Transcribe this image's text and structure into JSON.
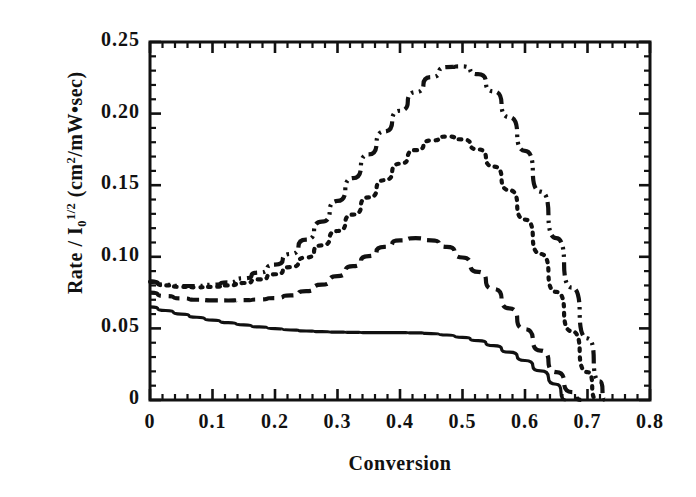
{
  "chart_data": {
    "type": "line",
    "title": "",
    "xlabel": "Conversion",
    "ylabel_parts": {
      "lead": "Rate / I",
      "sub": "0",
      "sup": "1/2",
      "tail": " (cm",
      "sup2": "2",
      "tail2": "/mW•sec)"
    },
    "ylabel_plain": "Rate / I0 1/2 (cm2/mW•sec)",
    "xlim": [
      0,
      0.8
    ],
    "ylim": [
      0,
      0.25
    ],
    "xticks": [
      "0",
      "0.1",
      "0.2",
      "0.3",
      "0.4",
      "0.5",
      "0.6",
      "0.7",
      "0.8"
    ],
    "xtick_values": [
      0,
      0.1,
      0.2,
      0.3,
      0.4,
      0.5,
      0.6,
      0.7,
      0.8
    ],
    "yticks": [
      "0",
      "0.05",
      "0.10",
      "0.15",
      "0.20",
      "0.25"
    ],
    "ytick_values": [
      0,
      0.05,
      0.1,
      0.15,
      0.2,
      0.25
    ],
    "x_minor_per_major": 5,
    "y_minor_per_major": 5,
    "grid": false,
    "legend": "none",
    "frame": true,
    "ticks_direction": "in",
    "line_color": "#111111",
    "series": [
      {
        "name": "solid",
        "style": "solid",
        "dash": "none",
        "x": [
          0.0,
          0.025,
          0.05,
          0.075,
          0.1,
          0.125,
          0.15,
          0.175,
          0.2,
          0.225,
          0.25,
          0.275,
          0.3,
          0.325,
          0.35,
          0.375,
          0.4,
          0.425,
          0.45,
          0.475,
          0.5,
          0.525,
          0.55,
          0.575,
          0.6,
          0.625,
          0.65,
          0.665
        ],
        "y": [
          0.065,
          0.0625,
          0.06,
          0.0578,
          0.0558,
          0.054,
          0.0524,
          0.051,
          0.0498,
          0.0489,
          0.0482,
          0.0477,
          0.0474,
          0.0472,
          0.0471,
          0.0471,
          0.0471,
          0.0469,
          0.0464,
          0.0454,
          0.0438,
          0.0414,
          0.038,
          0.0334,
          0.0276,
          0.0204,
          0.011,
          0.0
        ]
      },
      {
        "name": "dashed",
        "style": "dashed",
        "dash": "12 7",
        "x": [
          0.0,
          0.025,
          0.05,
          0.075,
          0.1,
          0.125,
          0.15,
          0.175,
          0.2,
          0.225,
          0.25,
          0.275,
          0.3,
          0.325,
          0.35,
          0.375,
          0.4,
          0.425,
          0.45,
          0.475,
          0.5,
          0.525,
          0.55,
          0.575,
          0.6,
          0.625,
          0.65,
          0.675,
          0.69
        ],
        "y": [
          0.075,
          0.0726,
          0.071,
          0.07,
          0.0696,
          0.0695,
          0.0697,
          0.0702,
          0.0712,
          0.073,
          0.076,
          0.0805,
          0.0865,
          0.0935,
          0.1005,
          0.107,
          0.1115,
          0.113,
          0.1115,
          0.107,
          0.0995,
          0.0895,
          0.0775,
          0.064,
          0.0495,
          0.0345,
          0.0195,
          0.0055,
          0.0
        ]
      },
      {
        "name": "dotted",
        "style": "dotted",
        "dash": "2.5 6",
        "x": [
          0.0,
          0.025,
          0.05,
          0.075,
          0.1,
          0.125,
          0.15,
          0.175,
          0.2,
          0.225,
          0.25,
          0.275,
          0.3,
          0.325,
          0.35,
          0.375,
          0.4,
          0.425,
          0.45,
          0.475,
          0.5,
          0.525,
          0.55,
          0.575,
          0.6,
          0.625,
          0.65,
          0.675,
          0.7,
          0.715
        ],
        "y": [
          0.0825,
          0.08,
          0.079,
          0.0787,
          0.079,
          0.08,
          0.0817,
          0.0842,
          0.0878,
          0.0928,
          0.0995,
          0.108,
          0.118,
          0.1295,
          0.1415,
          0.1535,
          0.165,
          0.1745,
          0.1812,
          0.184,
          0.182,
          0.175,
          0.163,
          0.1465,
          0.126,
          0.102,
          0.0755,
          0.048,
          0.0195,
          0.0
        ]
      },
      {
        "name": "dash-dot-dot",
        "style": "dashdotdot",
        "dash": "13 5 2.5 5 2.5 5",
        "x": [
          0.0,
          0.025,
          0.05,
          0.075,
          0.1,
          0.125,
          0.15,
          0.175,
          0.2,
          0.225,
          0.25,
          0.275,
          0.3,
          0.325,
          0.35,
          0.375,
          0.4,
          0.425,
          0.45,
          0.475,
          0.5,
          0.525,
          0.55,
          0.575,
          0.6,
          0.625,
          0.65,
          0.675,
          0.7,
          0.72,
          0.728
        ],
        "y": [
          0.0828,
          0.0805,
          0.0796,
          0.0796,
          0.0805,
          0.0822,
          0.085,
          0.089,
          0.0945,
          0.102,
          0.112,
          0.1245,
          0.139,
          0.155,
          0.1715,
          0.1875,
          0.202,
          0.215,
          0.2255,
          0.2325,
          0.233,
          0.2275,
          0.2155,
          0.1975,
          0.174,
          0.1455,
          0.113,
          0.0785,
          0.043,
          0.013,
          0.0
        ]
      }
    ]
  }
}
